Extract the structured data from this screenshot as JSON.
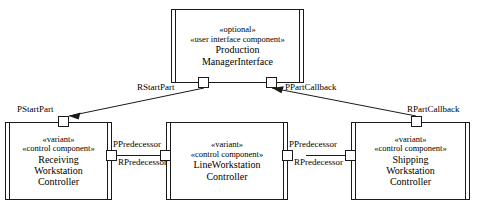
{
  "diagram": {
    "type": "UML component diagram",
    "clipped_caption": "",
    "components": [
      {
        "id": "production-manager-interface",
        "stereotypes": [
          "«optional»",
          "«user interface component»"
        ],
        "name_lines": [
          "Production",
          "ManagerInterface"
        ],
        "ports": [
          {
            "id": "rstartpart",
            "label": "RStartPart",
            "side": "bottom"
          },
          {
            "id": "ppartcallback",
            "label": "PPartCallback",
            "side": "bottom"
          }
        ]
      },
      {
        "id": "receiving-workstation-controller",
        "stereotypes": [
          "«variant»",
          "«control component»"
        ],
        "name_lines": [
          "Receiving",
          "Workstation",
          "Controller"
        ],
        "ports": [
          {
            "id": "pstartpart",
            "label": "PStartPart",
            "side": "top"
          },
          {
            "id": "ppredecessor-left",
            "label": "PPredecessor",
            "side": "right"
          }
        ]
      },
      {
        "id": "line-workstation-controller",
        "stereotypes": [
          "«variant»",
          "«control component»"
        ],
        "name_lines": [
          "LineWorkstation",
          "Controller"
        ],
        "ports": [
          {
            "id": "rpredecessor-left",
            "label": "RPredecessor",
            "side": "left"
          },
          {
            "id": "ppredecessor-right",
            "label": "PPredecessor",
            "side": "right"
          }
        ]
      },
      {
        "id": "shipping-workstation-controller",
        "stereotypes": [
          "«variant»",
          "«control component»"
        ],
        "name_lines": [
          "Shipping",
          "Workstation",
          "Controller"
        ],
        "ports": [
          {
            "id": "rpartcallback",
            "label": "RPartCallback",
            "side": "top"
          },
          {
            "id": "rpredecessor-right",
            "label": "RPredecessor",
            "side": "left"
          }
        ]
      }
    ],
    "connectors": [
      {
        "id": "conn-startpart",
        "from": "rstartpart",
        "to": "pstartpart",
        "arrow": "to"
      },
      {
        "id": "conn-partcallback",
        "from": "rpartcallback",
        "to": "ppartcallback",
        "arrow": "to"
      },
      {
        "id": "conn-predecessor-left",
        "from": "ppredecessor-left",
        "to": "rpredecessor-left",
        "arrow": "none"
      },
      {
        "id": "conn-predecessor-right",
        "from": "ppredecessor-right",
        "to": "rpredecessor-right",
        "arrow": "none"
      }
    ],
    "labels": {
      "rstartpart": "RStartPart",
      "ppartcallback": "PPartCallback",
      "pstartpart": "PStartPart",
      "rpartcallback": "RPartCallback",
      "ppredecessor_left": "PPredecessor",
      "rpredecessor_left": "RPredecessor",
      "ppredecessor_right": "PPredecessor",
      "rpredecessor_right": "RPredecessor"
    },
    "colors": {
      "stroke": "#1a1a1a",
      "background": "#ffffff",
      "text": "#000000"
    }
  }
}
